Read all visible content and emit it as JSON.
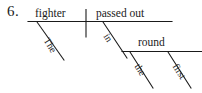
{
  "exercise": {
    "number": "6."
  },
  "colors": {
    "ink": "#1a1a1a",
    "background": "#ffffff"
  },
  "diagram": {
    "type": "sentence-diagram",
    "style": "reed-kellogg",
    "sentence": "The fighter passed out in the first round",
    "baseline": {
      "subject": "fighter",
      "predicate": "passed out",
      "divider": "|"
    },
    "modifiers": [
      {
        "word": "The",
        "attaches_to": "fighter",
        "slot": "subject-modifier"
      },
      {
        "word": "in",
        "attaches_to": "passed out",
        "slot": "prepositional-phrase"
      },
      {
        "word": "round",
        "attaches_to": "in",
        "slot": "object-of-preposition"
      },
      {
        "word": "the",
        "attaches_to": "round",
        "slot": "object-modifier-1"
      },
      {
        "word": "first",
        "attaches_to": "round",
        "slot": "object-modifier-2"
      }
    ]
  }
}
